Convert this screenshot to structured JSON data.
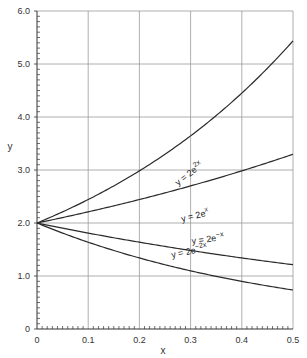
{
  "chart_data": {
    "type": "line",
    "title": "",
    "xlabel": "x",
    "ylabel": "y",
    "xlim": [
      0,
      0.5
    ],
    "ylim": [
      0,
      6.0
    ],
    "grid": true,
    "x_ticks": [
      "0",
      "0.1",
      "0.2",
      "0.3",
      "0.4",
      "0.5"
    ],
    "y_ticks": [
      "0",
      "1.0",
      "2.0",
      "3.0",
      "4.0",
      "5.0",
      "6.0"
    ],
    "x": [
      0,
      0.05,
      0.1,
      0.15,
      0.2,
      0.25,
      0.3,
      0.35,
      0.4,
      0.45,
      0.5
    ],
    "series": [
      {
        "name": "y = 2e^2x",
        "label_main": "y = 2e",
        "label_sup": "2x",
        "values": [
          2.0,
          2.21,
          2.44,
          2.7,
          2.98,
          3.3,
          3.64,
          4.03,
          4.45,
          4.92,
          5.44
        ]
      },
      {
        "name": "y = 2e^x",
        "label_main": "y = 2e",
        "label_sup": "x",
        "values": [
          2.0,
          2.1,
          2.21,
          2.32,
          2.44,
          2.57,
          2.7,
          2.84,
          2.98,
          3.14,
          3.3
        ]
      },
      {
        "name": "y = 2e^-x",
        "label_main": "y = 2e",
        "label_sup": "−x",
        "values": [
          2.0,
          1.9,
          1.81,
          1.72,
          1.64,
          1.56,
          1.48,
          1.41,
          1.34,
          1.28,
          1.21
        ]
      },
      {
        "name": "y = 2e^-2x",
        "label_main": "y = 2e",
        "label_sup": "−2x",
        "values": [
          2.0,
          1.81,
          1.64,
          1.48,
          1.34,
          1.21,
          1.1,
          0.99,
          0.9,
          0.81,
          0.74
        ]
      }
    ]
  }
}
